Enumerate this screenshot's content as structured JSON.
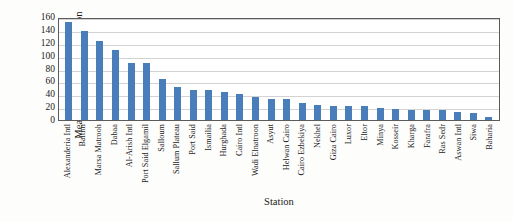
{
  "chart_data": {
    "type": "bar",
    "title": "",
    "xlabel": "Station",
    "ylabel_line1": "Mean of Annual Precipitation",
    "ylabel_line2": "(mm)",
    "ylabel": "Mean of Annual Precipitation (mm)",
    "ylim": [
      0,
      160
    ],
    "yticks": [
      0,
      20,
      40,
      60,
      80,
      100,
      120,
      140,
      160
    ],
    "grid": true,
    "legend": "none",
    "bar_color": "#4a7ebb",
    "plot_border_color": "#5b5b5b",
    "gridline_color": "#d2d2d2",
    "categories": [
      "Alexanderia Intl",
      "Baltim",
      "Marsa Matrooh",
      "Dabaa",
      "Al-Arish Intl",
      "Port Said Elgamil",
      "Salloum",
      "Sallum Plateau",
      "Port Said",
      "Ismailia",
      "Hurghada",
      "Cairo Intl",
      "Wadi Elnatroon",
      "Asyut",
      "Helwan Cairo",
      "Cairo Ezbekiya",
      "Nekhel",
      "Giza Cairo",
      "Luxor",
      "Eltor",
      "Minya",
      "Kosseir",
      "Kharga",
      "Farafra",
      "Ras Sedr",
      "Aswan Intl",
      "Siwa",
      "Baharia"
    ],
    "values": [
      152,
      139,
      123,
      108,
      89,
      89,
      63,
      51,
      46,
      46,
      43,
      40,
      35,
      32,
      32,
      26,
      23,
      22,
      22,
      21,
      18,
      17,
      16,
      16,
      15,
      12,
      11,
      5
    ]
  }
}
